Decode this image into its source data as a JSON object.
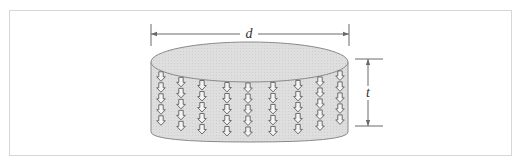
{
  "figure": {
    "type": "cylinder-disc-dimension-diagram",
    "frame_color": "#d6d6d6",
    "cylinder_fill": "#dcdcdc",
    "cylinder_stroke": "#8a8a8a",
    "arrow_stroke": "#6a6a6a",
    "dimension_color": "#6a6a6a",
    "arrow_icon": "down-arrow-icon",
    "arrow_columns": 9,
    "arrows_per_column": 5
  },
  "labels": {
    "diameter": "d",
    "thickness": "t"
  }
}
